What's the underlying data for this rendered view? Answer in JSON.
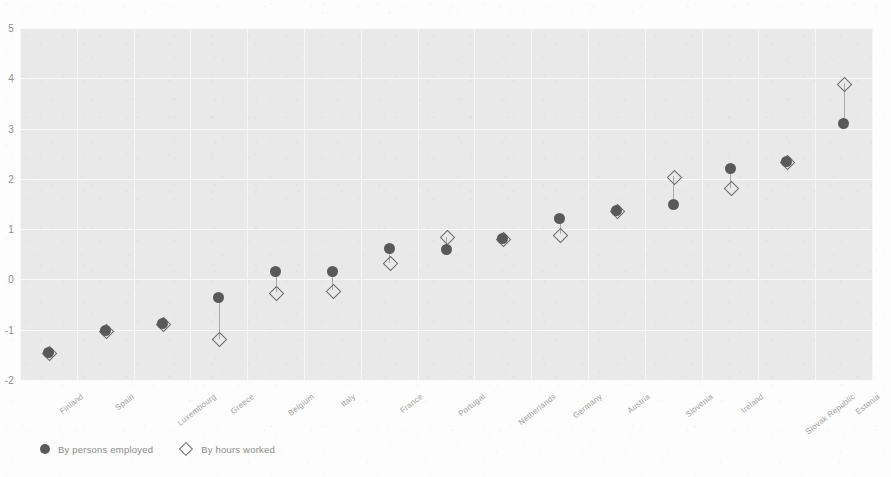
{
  "chart_data": {
    "type": "scatter",
    "title": "",
    "subtitle": "",
    "xlabel": "",
    "ylabel": "",
    "ylim": [
      -2,
      5
    ],
    "yticks": [
      5,
      4,
      3,
      2,
      1,
      0,
      -1,
      -2
    ],
    "ytick_labels": [
      "5",
      "4",
      "3",
      "2",
      "1",
      "0",
      "-1",
      "-2"
    ],
    "grid": true,
    "legend_position": "bottom-left",
    "categories": [
      "Finland",
      "Spain",
      "Luxembourg",
      "Greece",
      "Belgium",
      "Italy",
      "France",
      "Portugal",
      "Netherlands",
      "Germany",
      "Austria",
      "Slovenia",
      "Ireland",
      "Slovak Republic",
      "Estonia"
    ],
    "series": [
      {
        "name": "By persons employed",
        "marker": "filled-circle",
        "color": "#595959",
        "values": [
          -1.45,
          -1.02,
          -0.88,
          -0.35,
          0.15,
          0.15,
          0.62,
          0.6,
          0.82,
          1.22,
          1.38,
          1.5,
          2.2,
          2.35,
          3.1
        ]
      },
      {
        "name": "By hours worked",
        "marker": "open-diamond",
        "color": "#6a6a6a",
        "values": [
          -1.45,
          -1.02,
          -0.88,
          -1.18,
          -0.25,
          -0.22,
          0.33,
          0.85,
          0.82,
          0.9,
          1.38,
          2.05,
          1.82,
          2.35,
          3.9
        ]
      }
    ]
  },
  "legend": {
    "items": [
      {
        "label": "By persons employed",
        "marker": "filled-circle-icon"
      },
      {
        "label": "By hours worked",
        "marker": "open-diamond-icon"
      }
    ]
  }
}
